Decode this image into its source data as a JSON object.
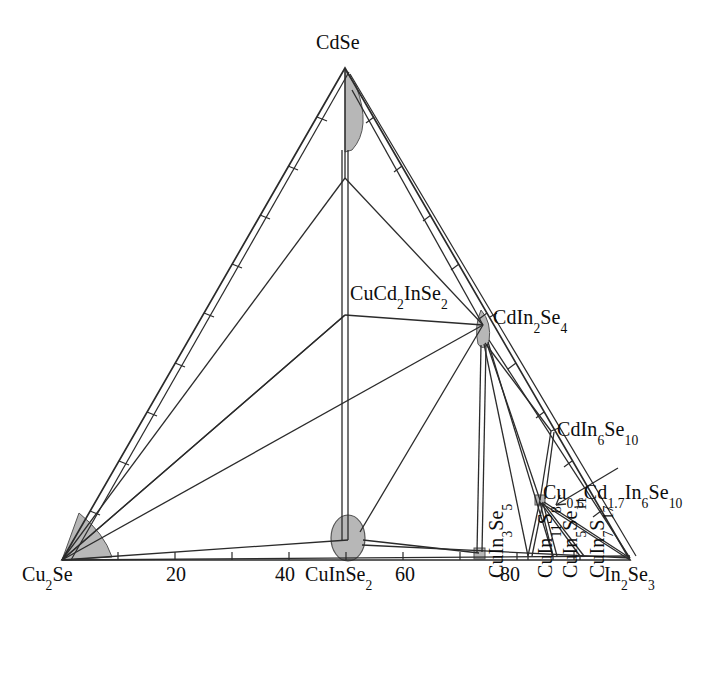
{
  "figure": {
    "kind": "ternary-phase-diagram",
    "background": "#ffffff",
    "line_color": "#2b2b2b",
    "shade_color": "#b7b7b7",
    "shade_stroke": "#5a5a5a",
    "text_color": "#0d0d0d"
  },
  "corners": {
    "top": {
      "label_html": "CdSe",
      "x": 345,
      "y": 68
    },
    "bottom_left": {
      "label_html": "Cu<sub>2</sub>Se",
      "x": 62,
      "y": 560
    },
    "bottom_right": {
      "label_html": "In<sub>2</sub>Se<sub>3</sub>",
      "x": 630,
      "y": 560
    }
  },
  "axis": {
    "bottom_ticks": [
      "20",
      "40",
      "60",
      "80"
    ],
    "bottom_tick_values": [
      20,
      40,
      60,
      80
    ],
    "tick_interval": 10,
    "range": [
      0,
      100
    ]
  },
  "labels": [
    {
      "id": "cdse",
      "html": "CdSe",
      "x": 316,
      "y": 32,
      "orient": "h"
    },
    {
      "id": "cu2se",
      "html": "Cu<sub>2</sub>Se",
      "x": 22,
      "y": 566,
      "orient": "h"
    },
    {
      "id": "in2se3",
      "html": "In<sub>2</sub>Se<sub>3</sub>",
      "x": 604,
      "y": 566,
      "orient": "h"
    },
    {
      "id": "t20",
      "html": "20",
      "x": 166,
      "y": 566,
      "orient": "h"
    },
    {
      "id": "t40",
      "html": "40",
      "x": 275,
      "y": 566,
      "orient": "h"
    },
    {
      "id": "cuinse2",
      "html": "CuInSe<sub>2</sub>",
      "x": 305,
      "y": 566,
      "orient": "h"
    },
    {
      "id": "t60",
      "html": "60",
      "x": 395,
      "y": 566,
      "orient": "h"
    },
    {
      "id": "t80",
      "html": "80",
      "x": 500,
      "y": 566,
      "orient": "h"
    },
    {
      "id": "cucd2inse2",
      "html": "CuCd<sub>2</sub>InSe<sub>2</sub>",
      "x": 350,
      "y": 284,
      "orient": "h"
    },
    {
      "id": "cdin2se4",
      "html": "CdIn<sub>2</sub>Se<sub>4</sub>",
      "x": 493,
      "y": 308,
      "orient": "h"
    },
    {
      "id": "cdin6se10",
      "html": "CdIn<sub>6</sub>Se<sub>10</sub>",
      "x": 557,
      "y": 420,
      "orient": "h"
    },
    {
      "id": "cucdinse",
      "html": "Cu<sub>0.6</sub>Cd<sub>1.7</sub>In<sub>6</sub>Se<sub>10</sub>",
      "x": 543,
      "y": 483,
      "orient": "h"
    },
    {
      "id": "cuin3se5",
      "html": "CuIn<sub>3</sub>Se<sub>5</sub>",
      "x": 479,
      "y": 582,
      "orient": "v"
    },
    {
      "id": "cuin11s8",
      "html": "CuIn<sub>11</sub>S<sub>8</sub>",
      "x": 528,
      "y": 582,
      "orient": "v"
    },
    {
      "id": "cuin5se11",
      "html": "CuIn<sub>5</sub>Se<sub>11</sub>",
      "x": 553,
      "y": 582,
      "orient": "v"
    },
    {
      "id": "cuin7s17",
      "html": "CuIn<sub>7</sub>S<sub>17</sub>",
      "x": 580,
      "y": 582,
      "orient": "v"
    }
  ],
  "nodes": [
    {
      "id": "cdse-apex",
      "x": 345,
      "y": 68
    },
    {
      "id": "cu2se-corner",
      "x": 62,
      "y": 560
    },
    {
      "id": "in2se3-corner",
      "x": 630,
      "y": 560
    },
    {
      "id": "upper-mid",
      "x": 345,
      "y": 178
    },
    {
      "id": "cucd2inse2",
      "x": 345,
      "y": 315
    },
    {
      "id": "cdin2se4",
      "x": 483,
      "y": 325
    },
    {
      "id": "cdin6se10",
      "x": 551,
      "y": 431
    },
    {
      "id": "cucdinse",
      "x": 540,
      "y": 500
    },
    {
      "id": "cuinse2",
      "x": 348,
      "y": 540
    },
    {
      "id": "cuin3se5",
      "x": 479,
      "y": 558
    },
    {
      "id": "cuin11s8",
      "x": 528,
      "y": 558
    },
    {
      "id": "cuin5se11",
      "x": 553,
      "y": 558
    },
    {
      "id": "cuin7s17",
      "x": 580,
      "y": 558
    }
  ],
  "shaded_regions": [
    {
      "id": "cdse-apex-region",
      "shape": "apex-wedge"
    },
    {
      "id": "cu2se-corner-fan",
      "shape": "corner-fan"
    },
    {
      "id": "cuinse2-ellipse",
      "shape": "ellipse",
      "cx": 348,
      "cy": 538,
      "rx": 17,
      "ry": 23
    },
    {
      "id": "cdin2se4-lens",
      "shape": "lens"
    },
    {
      "id": "cuin3se5-dot",
      "shape": "dot",
      "cx": 479,
      "cy": 553,
      "r": 5
    },
    {
      "id": "cucdinse-dot",
      "shape": "dot",
      "cx": 540,
      "cy": 500,
      "r": 4
    }
  ],
  "chart_data": {
    "type": "ternary-phase-diagram",
    "title": "",
    "components": [
      "Cu2Se",
      "CdSe",
      "In2Se3"
    ],
    "axis_ticks": [
      20,
      40,
      60,
      80
    ],
    "phases": [
      {
        "name": "CdSe",
        "position_label": "top apex"
      },
      {
        "name": "Cu2Se",
        "position_label": "bottom-left apex"
      },
      {
        "name": "In2Se3",
        "position_label": "bottom-right apex"
      },
      {
        "name": "CuInSe2",
        "position_label": "bottom edge ~50"
      },
      {
        "name": "CuCd2InSe2",
        "position_label": "interior"
      },
      {
        "name": "CdIn2Se4",
        "position_label": "right edge"
      },
      {
        "name": "CdIn6Se10",
        "position_label": "right edge lower"
      },
      {
        "name": "Cu0.6Cd1.7In6Se10",
        "position_label": "interior lower-right"
      },
      {
        "name": "CuIn3Se5",
        "position_label": "bottom edge ~73"
      },
      {
        "name": "CuIn11S8",
        "position_label": "bottom edge ~82"
      },
      {
        "name": "CuIn5Se11",
        "position_label": "bottom edge ~86"
      },
      {
        "name": "CuIn7S17",
        "position_label": "bottom edge ~91"
      }
    ]
  }
}
